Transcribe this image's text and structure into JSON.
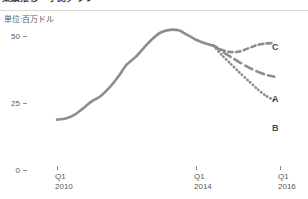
{
  "header": {
    "title": "業績推移・予測グラフ",
    "divider": true
  },
  "unit_label": "単位:百万ドル",
  "colors": {
    "line": "#8d8d8f",
    "axis": "#8d8d8f",
    "text": "#59595b",
    "label": "#4d4d4f",
    "background": "#ffffff"
  },
  "chart_data": {
    "type": "line",
    "title": "業績推移・予測グラフ",
    "xlabel": "",
    "ylabel": "単位:百万ドル",
    "ylim": [
      0,
      57
    ],
    "yticks": [
      0,
      25,
      50
    ],
    "ytick_labels": [
      "0",
      "25",
      "50"
    ],
    "xticks": [
      "Q1 2010",
      "Q1 2014",
      "Q1 2016"
    ],
    "xtick_labels": [
      {
        "quarter": "Q1",
        "year": "2010"
      },
      {
        "quarter": "Q1",
        "year": "2014"
      },
      {
        "quarter": "Q1",
        "year": "2016"
      }
    ],
    "xlim": [
      "Q1 2010",
      "Q3 2016"
    ],
    "grid": false,
    "legend": "right-inline",
    "series": [
      {
        "name": "実績",
        "label": "",
        "style": "solid",
        "color": "#8d8d8f",
        "x": [
          "Q1 2010",
          "Q2 2010",
          "Q3 2010",
          "Q4 2010",
          "Q1 2011",
          "Q2 2011",
          "Q3 2011",
          "Q4 2011",
          "Q1 2012",
          "Q2 2012",
          "Q3 2012",
          "Q4 2012",
          "Q1 2013",
          "Q2 2013",
          "Q3 2013",
          "Q4 2013",
          "Q1 2014",
          "Q2 2014",
          "Q3 2014"
        ],
        "values": [
          18.8,
          19.2,
          20.6,
          23.0,
          25.6,
          27.5,
          30.6,
          34.6,
          39.2,
          42.0,
          45.6,
          49.0,
          51.4,
          52.3,
          52.1,
          50.4,
          48.6,
          47.3,
          46.4
        ]
      },
      {
        "name": "C",
        "label": "C",
        "style": "dashed-short",
        "color": "#8d8d8f",
        "x": [
          "Q3 2014",
          "Q4 2014",
          "Q1 2015",
          "Q2 2015",
          "Q3 2015",
          "Q4 2015",
          "Q1 2016",
          "Q2 2016"
        ],
        "values": [
          46.4,
          44.8,
          44.0,
          44.2,
          45.4,
          46.6,
          47.2,
          47.4
        ]
      },
      {
        "name": "A",
        "label": "A",
        "style": "dashed-long",
        "color": "#8d8d8f",
        "x": [
          "Q3 2014",
          "Q4 2014",
          "Q1 2015",
          "Q2 2015",
          "Q3 2015",
          "Q4 2015",
          "Q1 2016",
          "Q2 2016"
        ],
        "values": [
          46.4,
          44.3,
          42.2,
          40.2,
          38.4,
          36.8,
          35.6,
          34.8
        ]
      },
      {
        "name": "B",
        "label": "B",
        "style": "dotted",
        "color": "#8d8d8f",
        "x": [
          "Q3 2014",
          "Q4 2014",
          "Q1 2015",
          "Q2 2015",
          "Q3 2015",
          "Q4 2015",
          "Q1 2016",
          "Q2 2016"
        ],
        "values": [
          46.4,
          42.8,
          39.6,
          36.4,
          33.4,
          30.4,
          27.8,
          26.0
        ]
      }
    ]
  }
}
